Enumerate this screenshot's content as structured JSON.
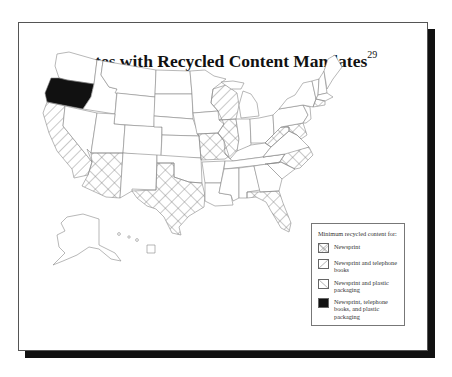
{
  "header_fragment": "",
  "figure": {
    "title": "States with Recycled Content Mandates",
    "title_footnote": "29"
  },
  "legend": {
    "heading": "Minimum recycled content for:",
    "items": [
      {
        "key": "newsprint",
        "label": "Newsprint",
        "pattern": "cross-hatch"
      },
      {
        "key": "newsprint_phone",
        "label": "Newsprint and telephone books",
        "pattern": "forward-diagonal"
      },
      {
        "key": "newsprint_plastic",
        "label": "Newsprint and plastic packaging",
        "pattern": "back-diagonal"
      },
      {
        "key": "all_three",
        "label": "Newsprint, telephone books, and plastic packaging",
        "pattern": "solid-black"
      }
    ]
  },
  "map_states": {
    "newsprint": [
      "Arizona",
      "Texas",
      "Missouri",
      "Illinois",
      "West Virginia",
      "Maryland",
      "North Carolina",
      "Florida",
      "Connecticut"
    ],
    "newsprint_phone": [
      "California",
      "Wisconsin"
    ],
    "newsprint_plastic": [],
    "all_three": [
      "Oregon"
    ]
  },
  "colors": {
    "frame_border": "#555555",
    "shadow": "#111111",
    "state_outline": "#888888",
    "solid_fill": "#111111",
    "hatch": "#777777"
  }
}
